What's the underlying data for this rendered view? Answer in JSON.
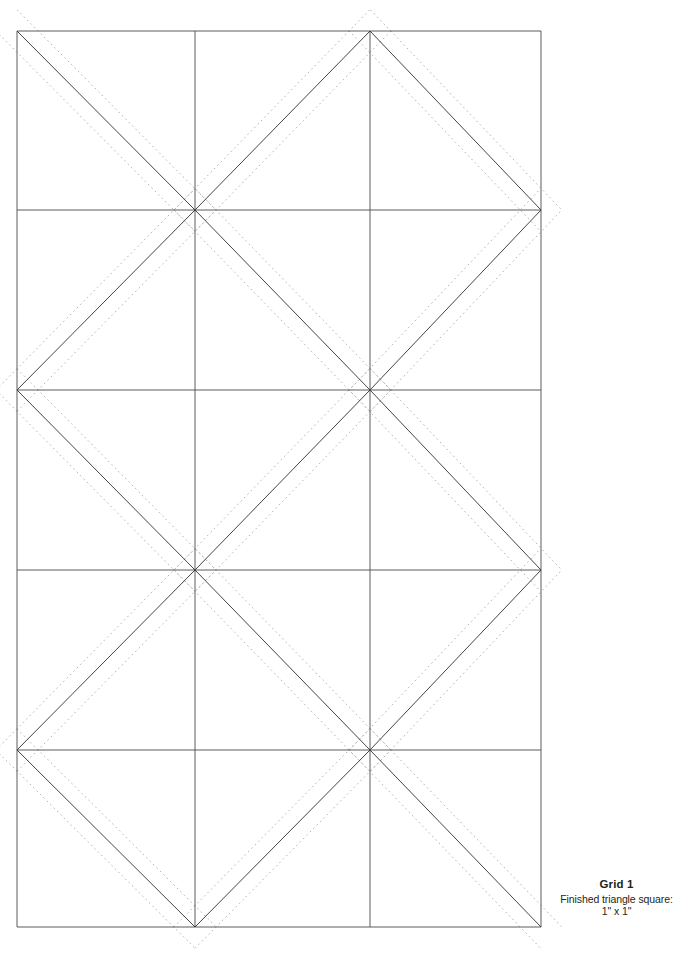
{
  "document": {
    "kind": "quilt-piecing-template",
    "background_color": "#ffffff"
  },
  "caption": {
    "title": "Grid 1",
    "line_1": "Finished triangle square:",
    "line_2": "1\" x 1\""
  },
  "pattern": {
    "solid_line_color": "#3a3a3a",
    "dotted_line_color": "#a9a9a9",
    "solid_line_width": 0.9,
    "dotted_line_width": 0.9,
    "dotted_dash_pattern": "1.6 3.2",
    "seam_offset_px": 15,
    "grid": {
      "left": 17,
      "right": 541,
      "top": 31,
      "bottom": 927,
      "verticals": [
        17,
        195,
        370,
        541
      ],
      "horizontals": [
        31,
        210,
        390,
        570,
        750,
        927
      ],
      "columns": 3,
      "rows": 5
    },
    "nodes": {
      "description": "Zigzag diagonal vertices, left-to-right alternating between grid corners",
      "peaks_x": [
        17,
        195,
        370,
        541
      ],
      "peaks_y": [
        31,
        210,
        390,
        570,
        750,
        927
      ]
    },
    "zigzag_solid": [
      {
        "name": "down-right-1",
        "points": "17,31 195,209 370,31"
      },
      {
        "name": "down-right-2",
        "points": "195,209 370,390 541,209"
      },
      {
        "name": "down-right-3",
        "points": "17,390 195,569 370,390"
      },
      {
        "name": "down-right-4",
        "points": "195,569 370,750 541,569"
      },
      {
        "name": "down-right-5",
        "points": "17,750 195,927 370,750"
      },
      {
        "name": "up-right-1",
        "points": "370,31 541,209"
      },
      {
        "name": "up-right-2",
        "points": "17,390 195,209"
      },
      {
        "name": "up-right-3",
        "points": "370,390 541,209"
      },
      {
        "name": "up-right-4",
        "points": "17,750 195,569"
      },
      {
        "name": "up-right-5",
        "points": "370,750 541,569"
      },
      {
        "name": "tail-1",
        "points": "541,750 370,927"
      },
      {
        "name": "tail-2",
        "points": "195,927 370,750"
      }
    ]
  }
}
